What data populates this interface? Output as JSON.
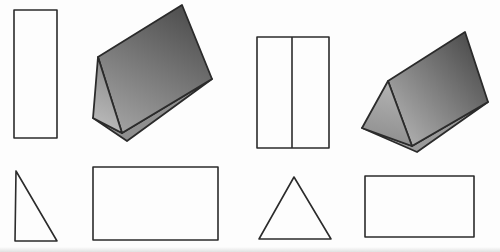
{
  "canvas": {
    "width": 500,
    "height": 252,
    "background": "#fdfdfd",
    "outline_color": "#2b2b2b",
    "outline_width": 1.6,
    "prism_outline_width": 1.8,
    "shape_fill": "#fdfdfd"
  },
  "gradients": [
    {
      "id": "grad-p1-face",
      "from": "#4e4e4e",
      "to": "#a2a2a2",
      "x1": "74%",
      "y1": "0%",
      "x2": "21%",
      "y2": "100%"
    },
    {
      "id": "grad-p1-tri",
      "from": "#8a8a8a",
      "to": "#bcbcbc",
      "x1": "55%",
      "y1": "0%",
      "x2": "35%",
      "y2": "100%"
    },
    {
      "id": "grad-p2-face",
      "from": "#525252",
      "to": "#acacac",
      "x1": "80%",
      "y1": "10%",
      "x2": "5%",
      "y2": "80%"
    },
    {
      "id": "grad-p2-tri",
      "from": "#b4b4b4",
      "to": "#8d8d8d",
      "x1": "55%",
      "y1": "0%",
      "x2": "40%",
      "y2": "100%"
    }
  ],
  "shapes": [
    {
      "name": "tall-rectangle",
      "kind": "outline-rect",
      "x": 14,
      "y": 10,
      "width": 43,
      "height": 128
    },
    {
      "name": "shaded-triangular-prism-left",
      "kind": "prism",
      "faces": [
        {
          "name": "prism-left-bottom-face",
          "points": "93,118 127,141 212,79 122,133",
          "fill": "#8f8f8f"
        },
        {
          "name": "prism-left-slant-face",
          "points": "98,57 182,5 212,79 122,133",
          "fill": "url(#grad-p1-face)"
        },
        {
          "name": "prism-left-end-triangle-face",
          "points": "98,57 93,118 122,133",
          "fill": "url(#grad-p1-tri)"
        }
      ]
    },
    {
      "name": "divided-rectangle",
      "kind": "outline-rect",
      "x": 257,
      "y": 37,
      "width": 72,
      "height": 111,
      "divider_x": 292
    },
    {
      "name": "shaded-triangular-prism-right",
      "kind": "prism",
      "faces": [
        {
          "name": "prism-right-bottom-face",
          "points": "362,128 417,152 488,102 412,146",
          "fill": "#9a9a9a"
        },
        {
          "name": "prism-right-slant-face",
          "points": "388,81 465,32 488,102 412,146",
          "fill": "url(#grad-p2-face)"
        },
        {
          "name": "prism-right-end-triangle-face",
          "points": "388,81 362,128 412,146",
          "fill": "url(#grad-p2-tri)"
        }
      ]
    },
    {
      "name": "right-triangle",
      "kind": "outline-polygon",
      "points": "16,171 15,241 57,241"
    },
    {
      "name": "wide-rectangle-left",
      "kind": "outline-rect",
      "x": 93,
      "y": 167,
      "width": 125,
      "height": 73
    },
    {
      "name": "isosceles-triangle",
      "kind": "outline-polygon",
      "points": "294,177 259,239 331,239"
    },
    {
      "name": "wide-rectangle-right",
      "kind": "outline-rect",
      "x": 365,
      "y": 176,
      "width": 109,
      "height": 61
    }
  ]
}
